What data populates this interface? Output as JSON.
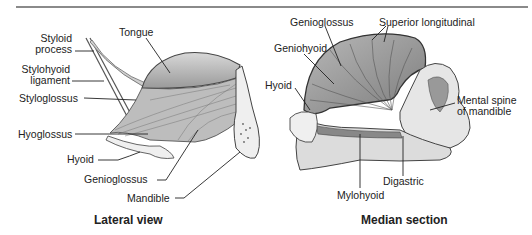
{
  "figure": {
    "lateral": {
      "caption": "Lateral view",
      "labels": {
        "styloid_process_1": "Styloid",
        "styloid_process_2": "process",
        "tongue": "Tongue",
        "stylohyoid_1": "Stylohyoid",
        "stylohyoid_2": "ligament",
        "styloglossus": "Styloglossus",
        "hyoglossus": "Hyoglossus",
        "hyoid": "Hyoid",
        "genioglossus": "Genioglossus",
        "mandible": "Mandible"
      }
    },
    "median": {
      "caption": "Median section",
      "labels": {
        "genioglossus": "Genioglossus",
        "superior_longitudinal": "Superior longitudinal",
        "geniohyoid": "Geniohyoid",
        "hyoid": "Hyoid",
        "mental_spine_1": "Mental spine",
        "mental_spine_2": "of mandible",
        "digastric": "Digastric",
        "mylohyoid": "Mylohyoid"
      }
    }
  }
}
